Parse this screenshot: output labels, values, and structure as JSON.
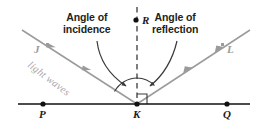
{
  "diagram": {
    "callouts": {
      "incidence_line1": "Angle of",
      "incidence_line2": "incidence",
      "reflection_line1": "Angle of",
      "reflection_line2": "reflection"
    },
    "labels": {
      "P": "P",
      "K": "K",
      "Q": "Q",
      "R": "R",
      "J": "J",
      "L": "L",
      "light_waves": "light waves"
    },
    "colors": {
      "surface_line": "#111111",
      "ray": "#9b9b9b",
      "normal_dashed": "#3a3a3a",
      "callout_text": "#231f20",
      "gray_label": "#9a9a9a",
      "arc": "#3a3a3a",
      "background": "#ffffff"
    },
    "geometry": {
      "vertex_K": [
        137,
        104
      ],
      "point_P": [
        43,
        104
      ],
      "point_Q": [
        227,
        104
      ],
      "point_R": [
        137,
        21
      ],
      "incident_ray_start": [
        22,
        30
      ],
      "reflected_ray_end": [
        250,
        30
      ],
      "normal_top": [
        137,
        8
      ],
      "surface_left": [
        18,
        104
      ],
      "surface_right": [
        250,
        104
      ]
    }
  }
}
